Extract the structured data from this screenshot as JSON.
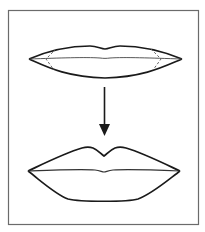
{
  "figure": {
    "frame": {
      "border_color": "#6b6b6b",
      "background": "#ffffff"
    },
    "stroke_color": "#1a1a1a",
    "guide_color": "#555555",
    "panels": [
      {
        "id": "before",
        "label": "Thin lips with dashed guide lines at corners"
      },
      {
        "id": "after",
        "label": "Fuller lips with defined cupid's bow"
      }
    ],
    "arrow": {
      "direction": "down"
    }
  }
}
